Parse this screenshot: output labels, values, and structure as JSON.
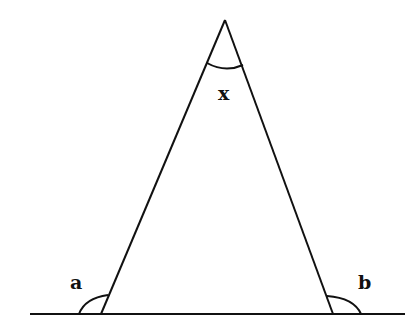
{
  "diagram": {
    "type": "geometry",
    "stroke_color": "#111111",
    "background": "#ffffff",
    "baseline": {
      "x1": 30,
      "y1": 314,
      "x2": 405,
      "y2": 314
    },
    "vertices": {
      "apex": {
        "x": 225,
        "y": 20
      },
      "left": {
        "x": 101,
        "y": 314
      },
      "right": {
        "x": 333,
        "y": 314
      }
    },
    "labels": {
      "apex_angle": "x",
      "left_exterior_angle": "a",
      "right_exterior_angle": "b"
    }
  }
}
